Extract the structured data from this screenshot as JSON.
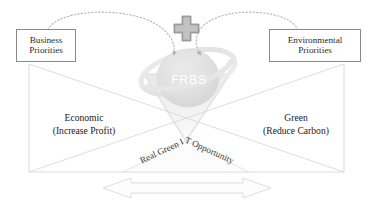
{
  "diagram": {
    "center_logo": {
      "label": "FRBS",
      "icon": "globe-orbit-logo"
    },
    "center_symbol": {
      "icon": "plus-cross-icon",
      "label": "+"
    },
    "boxes": [
      {
        "id": "business-priorities",
        "line1": "Business",
        "line2": "Priorities"
      },
      {
        "id": "environmental-priorities",
        "line1": "Environmental",
        "line2": "Priorities"
      }
    ],
    "quadrants": [
      {
        "id": "economic",
        "line1": "Economic",
        "line2": "(Increase Profit)"
      },
      {
        "id": "green",
        "line1": "Green",
        "line2": "(Reduce Carbon)"
      }
    ],
    "arc_label": "Real Green IT Opportunity",
    "bottom_arrow": {
      "icon": "double-headed-arrow-icon",
      "label": ""
    },
    "colors": {
      "box_border": "#8a8a8a",
      "text": "#222222",
      "logo_fill": "#e3e3e3",
      "logo_ring": "#e9e9e9",
      "logo_label": "#ffffff",
      "line": "#d8d8d8",
      "dotted_arc": "#b5b5b5",
      "cross": "#9a9a9a",
      "background": "#ffffff"
    }
  }
}
